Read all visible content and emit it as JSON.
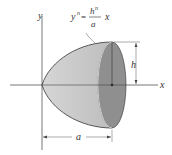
{
  "diagram": {
    "axes": {
      "x_label": "x",
      "y_label": "y"
    },
    "equation": {
      "lhs": "y",
      "lhs_exp": "n",
      "equals": "=",
      "numerator": "h",
      "numerator_exp": "n",
      "denominator": "a",
      "rhs": "x"
    },
    "dimensions": {
      "height_label": "h",
      "length_label": "a"
    },
    "colors": {
      "body_fill": "#c9c9c9",
      "cap_fill": "#8f8f8f",
      "outline": "#333333",
      "axis": "#555555"
    }
  }
}
